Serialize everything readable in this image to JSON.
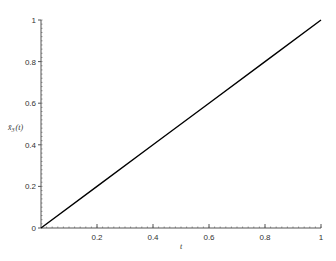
{
  "chart_data": {
    "type": "line",
    "title": "",
    "xlabel": "t",
    "ylabel": "x̄₃(t)",
    "ylabel_parts": {
      "main": "x̄",
      "sub": "3",
      "arg": "(t)"
    },
    "xlim": [
      0,
      1
    ],
    "ylim": [
      0,
      1
    ],
    "grid": false,
    "legend": null,
    "x_ticks": [
      0.2,
      0.4,
      0.6,
      0.8,
      1
    ],
    "x_tick_labels": [
      "0.2",
      "0.4",
      "0.6",
      "0.8",
      "1"
    ],
    "y_ticks": [
      0,
      0.2,
      0.4,
      0.6,
      0.8,
      1
    ],
    "y_tick_labels": [
      "0",
      "0.2",
      "0.4",
      "0.6",
      "0.8",
      "1"
    ],
    "series": [
      {
        "name": "x̄₃(t)",
        "color": "#000000",
        "x": [
          0,
          0.2,
          0.4,
          0.6,
          0.8,
          1
        ],
        "y": [
          0,
          0.2,
          0.4,
          0.6,
          0.8,
          1
        ]
      }
    ]
  },
  "layout": {
    "origin_px": [
      41,
      228
    ],
    "x_end_px": 321,
    "y_top_px": 20,
    "axis_color": "#555555",
    "line_color": "#000000"
  }
}
